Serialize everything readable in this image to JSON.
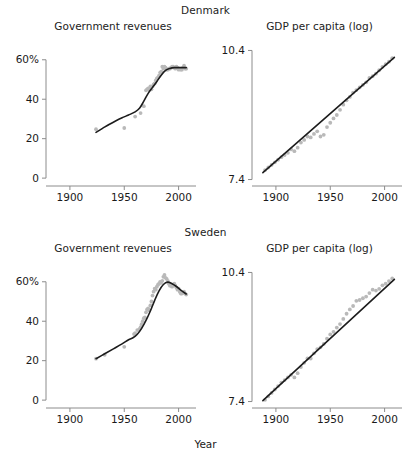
{
  "figure": {
    "xlabel": "Year",
    "point_color": "#b9b9b9",
    "line_color": "#1c1c1c",
    "axis_color": "#8c8c8c"
  },
  "strips": [
    {
      "label": "Denmark"
    },
    {
      "label": "Sweden"
    }
  ],
  "panel_titles": {
    "revenues": "Government revenues",
    "gdp": "GDP per capita (log)"
  },
  "axes": {
    "revenue_yticks": [
      "60%",
      "40",
      "20",
      "0"
    ],
    "revenue_ytick_values": [
      60,
      40,
      20,
      0
    ],
    "gdp_yticks": [
      "10.4",
      "7.4"
    ],
    "gdp_ytick_values": [
      10.4,
      7.4
    ],
    "xticks": [
      "1900",
      "1950",
      "2000"
    ],
    "xtick_values": [
      1900,
      1950,
      2000
    ],
    "revenue_ylim": [
      -4,
      68
    ],
    "gdp_ylim": [
      7.25,
      10.55
    ],
    "xlim": [
      1878,
      2016
    ]
  },
  "chart_data": [
    {
      "type": "scatter",
      "title": "Government revenues",
      "panel": "Denmark / Government revenues",
      "xlabel": "Year",
      "ylabel": "",
      "xlim": [
        1878,
        2016
      ],
      "ylim": [
        -4,
        68
      ],
      "grid": false,
      "legend": "none",
      "x": [
        1924,
        1950,
        1960,
        1965,
        1968,
        1970,
        1971,
        1972,
        1973,
        1974,
        1975,
        1976,
        1977,
        1978,
        1979,
        1980,
        1981,
        1982,
        1983,
        1984,
        1985,
        1986,
        1987,
        1988,
        1989,
        1990,
        1991,
        1992,
        1993,
        1994,
        1995,
        1996,
        1997,
        1998,
        1999,
        2000,
        2001,
        2002,
        2003,
        2004,
        2005,
        2006,
        2007
      ],
      "y": [
        24.8,
        25.4,
        31.2,
        33.0,
        36.5,
        44.5,
        45.0,
        45.5,
        44.8,
        46.5,
        45.0,
        46.5,
        47.5,
        48.0,
        49.5,
        50.5,
        51.0,
        52.0,
        53.5,
        54.0,
        56.5,
        55.5,
        56.5,
        56.0,
        55.0,
        55.0,
        55.5,
        55.5,
        56.0,
        56.5,
        56.5,
        56.0,
        55.5,
        56.5,
        56.0,
        55.0,
        55.5,
        55.0,
        55.0,
        56.0,
        57.0,
        55.5,
        55.5
      ],
      "trend": {
        "name": "smoothed trend",
        "x": [
          1924,
          1930,
          1936,
          1942,
          1948,
          1954,
          1960,
          1964,
          1968,
          1972,
          1976,
          1980,
          1984,
          1988,
          1992,
          1996,
          2000,
          2004,
          2007
        ],
        "y": [
          23.2,
          25.2,
          27.2,
          29.0,
          30.6,
          32.0,
          33.6,
          35.4,
          39.0,
          43.0,
          46.0,
          49.0,
          52.2,
          54.6,
          55.6,
          56.0,
          56.0,
          56.0,
          56.0
        ]
      }
    },
    {
      "type": "scatter",
      "title": "GDP per capita (log)",
      "panel": "Denmark / GDP per capita (log)",
      "xlabel": "Year",
      "ylabel": "",
      "xlim": [
        1878,
        2016
      ],
      "ylim": [
        7.25,
        10.55
      ],
      "grid": false,
      "legend": "none",
      "x": [
        1890,
        1893,
        1896,
        1899,
        1902,
        1905,
        1908,
        1911,
        1914,
        1917,
        1920,
        1923,
        1926,
        1929,
        1932,
        1935,
        1938,
        1941,
        1944,
        1947,
        1950,
        1953,
        1956,
        1959,
        1962,
        1965,
        1968,
        1971,
        1974,
        1977,
        1980,
        1983,
        1986,
        1989,
        1992,
        1995,
        1998,
        2001,
        2004,
        2007
      ],
      "y": [
        7.62,
        7.68,
        7.74,
        7.8,
        7.86,
        7.92,
        7.97,
        8.02,
        8.1,
        8.06,
        8.14,
        8.26,
        8.32,
        8.4,
        8.38,
        8.46,
        8.52,
        8.4,
        8.44,
        8.62,
        8.72,
        8.82,
        8.9,
        9.02,
        9.14,
        9.24,
        9.32,
        9.42,
        9.48,
        9.54,
        9.6,
        9.66,
        9.76,
        9.8,
        9.86,
        9.94,
        10.02,
        10.08,
        10.14,
        10.22
      ],
      "trend": {
        "name": "linear fit",
        "x": [
          1888,
          2009
        ],
        "y": [
          7.56,
          10.24
        ]
      }
    },
    {
      "type": "scatter",
      "title": "Government revenues",
      "panel": "Sweden / Government revenues",
      "xlabel": "Year",
      "ylabel": "",
      "xlim": [
        1878,
        2016
      ],
      "ylim": [
        -4,
        68
      ],
      "grid": false,
      "legend": "none",
      "x": [
        1924,
        1932,
        1950,
        1959,
        1960,
        1962,
        1964,
        1965,
        1966,
        1967,
        1968,
        1969,
        1970,
        1971,
        1972,
        1973,
        1974,
        1975,
        1976,
        1977,
        1978,
        1979,
        1980,
        1981,
        1982,
        1983,
        1984,
        1985,
        1986,
        1987,
        1988,
        1989,
        1990,
        1991,
        1992,
        1993,
        1994,
        1995,
        1996,
        1997,
        1998,
        1999,
        2000,
        2001,
        2002,
        2003,
        2004,
        2005,
        2006,
        2007
      ],
      "y": [
        21.0,
        23.0,
        27.0,
        33.5,
        34.0,
        35.5,
        36.0,
        37.0,
        38.5,
        40.0,
        41.5,
        42.0,
        44.5,
        46.0,
        46.5,
        45.5,
        48.0,
        50.0,
        53.0,
        55.0,
        56.5,
        56.0,
        57.5,
        58.5,
        59.0,
        60.0,
        59.5,
        60.5,
        62.5,
        63.5,
        62.0,
        61.5,
        60.5,
        59.0,
        58.0,
        58.0,
        57.5,
        58.0,
        59.0,
        58.0,
        57.0,
        56.0,
        56.5,
        55.0,
        54.0,
        54.0,
        54.5,
        55.0,
        54.0,
        53.5
      ],
      "trend": {
        "name": "smoothed trend",
        "x": [
          1924,
          1932,
          1940,
          1948,
          1954,
          1958,
          1962,
          1966,
          1970,
          1974,
          1978,
          1982,
          1986,
          1990,
          1994,
          1998,
          2002,
          2007
        ],
        "y": [
          21.0,
          23.5,
          26.0,
          28.5,
          30.6,
          31.6,
          33.4,
          36.4,
          40.4,
          45.2,
          50.6,
          55.4,
          58.6,
          59.8,
          59.0,
          57.6,
          55.8,
          53.8
        ]
      }
    },
    {
      "type": "scatter",
      "title": "GDP per capita (log)",
      "panel": "Sweden / GDP per capita (log)",
      "xlabel": "Year",
      "ylabel": "",
      "xlim": [
        1878,
        2016
      ],
      "ylim": [
        7.25,
        10.55
      ],
      "grid": false,
      "legend": "none",
      "x": [
        1890,
        1893,
        1896,
        1899,
        1902,
        1905,
        1908,
        1911,
        1914,
        1917,
        1920,
        1923,
        1926,
        1929,
        1932,
        1935,
        1938,
        1941,
        1944,
        1947,
        1950,
        1953,
        1956,
        1959,
        1962,
        1965,
        1968,
        1971,
        1974,
        1977,
        1980,
        1983,
        1986,
        1989,
        1992,
        1995,
        1998,
        2001,
        2004,
        2007
      ],
      "y": [
        7.44,
        7.52,
        7.6,
        7.68,
        7.76,
        7.84,
        7.9,
        7.96,
        8.02,
        7.96,
        8.06,
        8.2,
        8.3,
        8.4,
        8.4,
        8.52,
        8.62,
        8.66,
        8.74,
        8.86,
        8.96,
        9.02,
        9.12,
        9.2,
        9.32,
        9.44,
        9.54,
        9.62,
        9.74,
        9.76,
        9.8,
        9.84,
        9.92,
        10.0,
        9.98,
        10.02,
        10.1,
        10.14,
        10.2,
        10.26
      ],
      "trend": {
        "name": "linear fit",
        "x": [
          1888,
          2009
        ],
        "y": [
          7.42,
          10.24
        ]
      }
    }
  ]
}
